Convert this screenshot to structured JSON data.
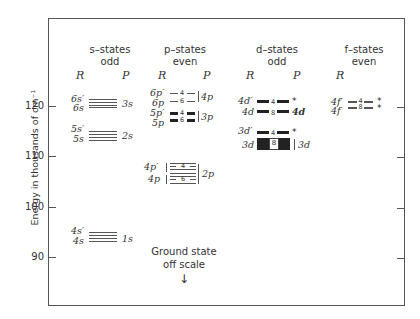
{
  "figure": {
    "y_axis": {
      "label": "Energy in thousands of cm⁻¹",
      "ticks": [
        "120",
        "110",
        "100",
        "90"
      ]
    },
    "columns": [
      {
        "title": "s–states",
        "parity": "odd",
        "headers": [
          "R",
          "P"
        ]
      },
      {
        "title": "p–states",
        "parity": "even",
        "headers": [
          "R",
          "P"
        ]
      },
      {
        "title": "d–states",
        "parity": "odd",
        "headers": [
          "R",
          "P"
        ]
      },
      {
        "title": "f–states",
        "parity": "even",
        "headers": [
          "R"
        ]
      }
    ],
    "s_states": {
      "groups": [
        {
          "r_upper": "6s′",
          "r_lower": "6s",
          "p": "3s"
        },
        {
          "r_upper": "5s′",
          "r_lower": "5s",
          "p": "2s"
        },
        {
          "r_upper": "4s′",
          "r_lower": "4s",
          "p": "1s"
        }
      ]
    },
    "p_states": {
      "groups": [
        {
          "r_upper": "6p′",
          "r_lower": "6p",
          "n_upper": "4",
          "n_lower": "6",
          "p": "4p"
        },
        {
          "r_upper": "5p′",
          "r_lower": "5p",
          "n_upper": "4",
          "n_lower": "6",
          "p": "3p"
        },
        {
          "r_upper": "4p′",
          "r_lower": "4p",
          "n_upper": "4",
          "n_lower": "6",
          "p": "2p"
        }
      ]
    },
    "d_states": {
      "groups": [
        {
          "r_upper": "4d′",
          "r_lower": "4d",
          "n_upper": "4",
          "n_lower": "8",
          "p_upper": "*",
          "p_lower": "4d"
        },
        {
          "r_upper": "3d′",
          "r_lower": "3d",
          "n_upper": "4",
          "n_lower": "8",
          "p_upper": "*",
          "p_lower": "3d"
        }
      ]
    },
    "f_states": {
      "groups": [
        {
          "r_upper": "4f′",
          "r_lower": "4f",
          "n_upper": "4",
          "n_lower": "8",
          "p_upper": "*",
          "p_lower": "*"
        }
      ]
    },
    "annotation": {
      "line1": "Ground state",
      "line2": "off scale",
      "arrow": "↓"
    }
  }
}
